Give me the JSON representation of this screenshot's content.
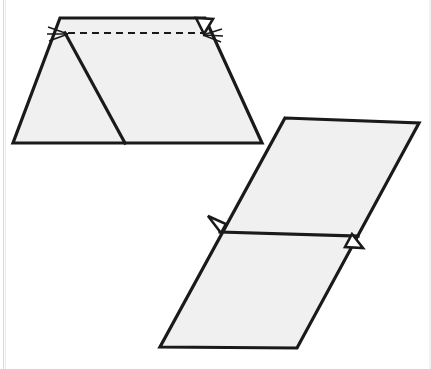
{
  "figure": {
    "title": "Geometric figure: trapezoid and parallelogram with congruence tick marks",
    "background_color": "#ffffff",
    "fill_color": "#f0f0f0",
    "stroke_color": "#1a1a1a",
    "canvas": {
      "width": 431,
      "height": 369
    }
  },
  "shapes": {
    "trapezoid": {
      "name": "Trapezoid with internal transversal",
      "outline_points": "60,18 205,18 262,143 13,143",
      "stroke_width": 3.2,
      "fill": "#f0f0f0",
      "interior_slant_line": {
        "x1": 65,
        "y1": 33,
        "x2": 125,
        "y2": 143,
        "stroke_width": 3.2
      },
      "dashed_line": {
        "x1": 68,
        "y1": 33,
        "x2": 203,
        "y2": 33,
        "dash_pattern": "7,5",
        "stroke_width": 2.2
      },
      "left_vertex": {
        "x": 65,
        "y": 33
      },
      "right_vertex": {
        "x": 204,
        "y": 33
      },
      "right_flap_points": "196,18 213,19 204,34",
      "left_tick_marks": [
        {
          "x1": 48,
          "y1": 27,
          "x2": 68,
          "y2": 34
        },
        {
          "x1": 47,
          "y1": 34,
          "x2": 68,
          "y2": 34
        },
        {
          "x1": 49,
          "y1": 41,
          "x2": 68,
          "y2": 34
        }
      ],
      "right_tick_marks": [
        {
          "x1": 203,
          "y1": 35,
          "x2": 222,
          "y2": 29
        },
        {
          "x1": 203,
          "y1": 35,
          "x2": 223,
          "y2": 36
        },
        {
          "x1": 203,
          "y1": 35,
          "x2": 221,
          "y2": 42
        }
      ]
    },
    "parallelogram": {
      "name": "Parallelogram divided by a horizontal line",
      "outline_points": "285,118 419,123 297,348 160,347",
      "stroke_width": 3.2,
      "fill": "#f0f0f0",
      "divider_line": {
        "x1": 220,
        "y1": 232,
        "x2": 358,
        "y2": 236,
        "stroke_width": 3.2
      },
      "left_tab_points": "208,216 226,224 221,233",
      "right_tab_points": "352,234 363,248 345,247",
      "left_midpoint": {
        "x": 221,
        "y": 232
      },
      "right_midpoint": {
        "x": 357,
        "y": 236
      }
    }
  },
  "annotations": {
    "tick_mark_count_left": 3,
    "tick_mark_count_right": 3,
    "tab_count": 3,
    "dashed_segment_count": 1
  }
}
